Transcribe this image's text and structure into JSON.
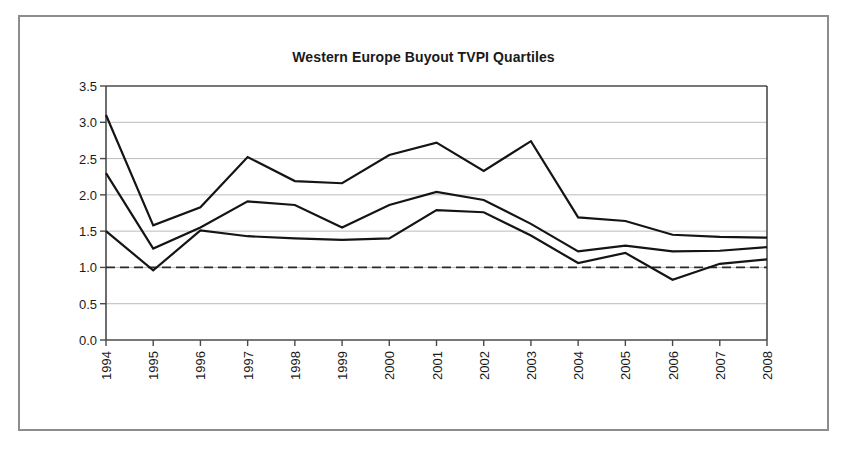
{
  "figure": {
    "title": "Western Europe Buyout TVPI Quartiles"
  },
  "chart_data": {
    "type": "line",
    "title": "Western Europe Buyout TVPI Quartiles",
    "xlabel": "",
    "ylabel": "",
    "categories": [
      "1994",
      "1995",
      "1996",
      "1997",
      "1998",
      "1999",
      "2000",
      "2001",
      "2002",
      "2003",
      "2004",
      "2005",
      "2006",
      "2007",
      "2008"
    ],
    "x_tick_labels": [
      "1994",
      "1995",
      "1996",
      "1997",
      "1998",
      "1999",
      "2000",
      "2001",
      "2002",
      "2003",
      "2004",
      "2005",
      "2006",
      "2007",
      "2008"
    ],
    "y_tick_labels": [
      "0.0",
      "0.5",
      "1.0",
      "1.5",
      "2.0",
      "2.5",
      "3.0",
      "3.5"
    ],
    "y_tick_values": [
      0.0,
      0.5,
      1.0,
      1.5,
      2.0,
      2.5,
      3.0,
      3.5
    ],
    "ylim": [
      0.0,
      3.5
    ],
    "y_tick_step": 0.5,
    "grid": "horizontal",
    "legend": "none",
    "series": [
      {
        "name": "Upper Quartile",
        "values": [
          3.1,
          1.58,
          1.83,
          2.52,
          2.19,
          2.16,
          2.55,
          2.72,
          2.33,
          2.74,
          1.69,
          1.64,
          1.45,
          1.42,
          1.41
        ]
      },
      {
        "name": "Median",
        "values": [
          2.3,
          1.26,
          1.55,
          1.91,
          1.86,
          1.55,
          1.86,
          2.04,
          1.93,
          1.6,
          1.22,
          1.3,
          1.22,
          1.23,
          1.28
        ]
      },
      {
        "name": "Lower Quartile",
        "values": [
          1.5,
          0.96,
          1.51,
          1.43,
          1.4,
          1.38,
          1.4,
          1.79,
          1.76,
          1.44,
          1.06,
          1.2,
          0.83,
          1.05,
          1.11
        ]
      }
    ],
    "reference_line": {
      "label": "1.0x",
      "value": 1.0,
      "style": "dashed"
    },
    "colors": {
      "series_line": "#141414",
      "gridline": "#a9a9a9",
      "axis": "#4a4a4a",
      "reference_line": "#2a2a2a",
      "frame_border": "#8d8d8d",
      "background": "#ffffff",
      "text": "#1a1a1a"
    }
  }
}
